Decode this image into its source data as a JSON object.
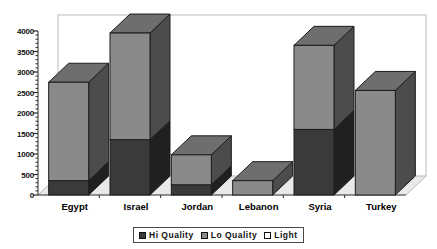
{
  "chart_data": {
    "type": "bar",
    "subtype": "stacked-3d-column",
    "title": "",
    "xlabel": "",
    "ylabel": "",
    "categories": [
      "Egypt",
      "Israel",
      "Jordan",
      "Lebanon",
      "Syria",
      "Turkey"
    ],
    "series": [
      {
        "name": "Hi Quality",
        "color": "#3a3a3a",
        "values": [
          350,
          1350,
          250,
          0,
          1600,
          0
        ]
      },
      {
        "name": "Lo Quality",
        "color": "#8a8a8a",
        "values": [
          2400,
          2600,
          730,
          350,
          2050,
          2550
        ]
      },
      {
        "name": "Light",
        "color": "#ffffff",
        "values": [
          0,
          0,
          0,
          0,
          0,
          0
        ]
      }
    ],
    "totals": [
      2750,
      3950,
      980,
      350,
      3650,
      2550
    ],
    "yticks": [
      0,
      500,
      1000,
      1500,
      2000,
      2500,
      3000,
      3500,
      4000
    ],
    "ytick_labels": [
      "0",
      "500",
      "1000",
      "1500",
      "2000",
      "2500",
      "3000",
      "3500",
      "4000"
    ],
    "ylim": [
      0,
      4000
    ],
    "minor_ticks": true,
    "grid": false,
    "legend_position": "bottom-center",
    "legend_entries": [
      "Hi Quality",
      "Lo Quality",
      "Light"
    ]
  },
  "colors": {
    "hi_quality": "#3a3a3a",
    "hi_quality_side": "#1f1f1f",
    "hi_quality_top": "#4a4a4a",
    "lo_quality": "#8a8a8a",
    "lo_quality_side": "#454545",
    "lo_quality_top": "#6e6e6e",
    "light": "#ffffff",
    "floor": "#e9e9e9",
    "wall": "#ffffff",
    "frame_line": "#b9b9b9",
    "axis_line": "#2b2b2b",
    "outline": "#1c1c1c"
  }
}
